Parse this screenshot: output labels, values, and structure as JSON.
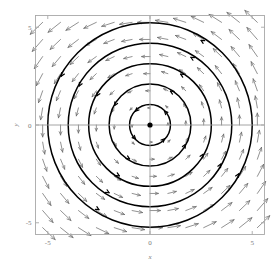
{
  "figure": {
    "kind": "phase-portrait",
    "background_color": "#ffffff",
    "frame_color": "#a8a8a8",
    "axis_color": "#9a9a9a",
    "trajectory_color": "#000000",
    "arrow_color": "#6e6e6e",
    "equilibrium_color": "#000000"
  },
  "axes": {
    "x_title": "x",
    "y_title": "y",
    "x_ticks": [
      "-5",
      "0",
      "5"
    ],
    "y_ticks": [
      "5",
      "0",
      "-5"
    ],
    "x_tick_values": [
      -5,
      0,
      5
    ],
    "y_tick_values": [
      5,
      0,
      -5
    ]
  },
  "chart_data": {
    "type": "scatter",
    "title": "",
    "subtitle": "",
    "xlabel": "x",
    "ylabel": "y",
    "xlim": [
      -5.6,
      5.6
    ],
    "ylim": [
      -5.6,
      5.6
    ],
    "xticks": [
      -5,
      0,
      5
    ],
    "yticks": [
      -5,
      0,
      5
    ],
    "xticklabels": [
      "-5",
      "0",
      "5"
    ],
    "yticklabels": [
      "-5",
      "0",
      "5"
    ],
    "grid": false,
    "legend": null,
    "plot_kind": "vector-field-with-trajectories",
    "field": {
      "name": "linear center",
      "description": "counterclockwise rotational vector field",
      "dx_expression": "-y",
      "dy_expression": "x",
      "rotation": "counterclockwise",
      "grid_spacing": 0.875,
      "grid_min": -5.25,
      "grid_max": 5.25,
      "arrow_scale": 0.115
    },
    "equilibria": [
      {
        "x": 0,
        "y": 0,
        "type": "center",
        "marker": "filled-circle"
      }
    ],
    "trajectories": [
      {
        "shape": "circle",
        "cx": 0,
        "cy": 0,
        "r": 1,
        "direction": "counterclockwise"
      },
      {
        "shape": "circle",
        "cx": 0,
        "cy": 0,
        "r": 2,
        "direction": "counterclockwise"
      },
      {
        "shape": "circle",
        "cx": 0,
        "cy": 0,
        "r": 3,
        "direction": "counterclockwise"
      },
      {
        "shape": "circle",
        "cx": 0,
        "cy": 0,
        "r": 4,
        "direction": "counterclockwise"
      },
      {
        "shape": "circle",
        "cx": 0,
        "cy": 0,
        "r": 5,
        "direction": "counterclockwise"
      }
    ]
  }
}
